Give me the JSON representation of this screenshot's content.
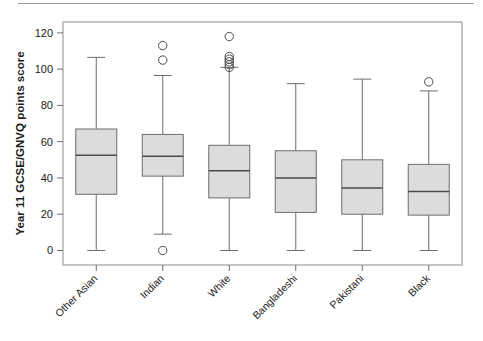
{
  "figure": {
    "top_rule_visible": true,
    "frame_color": "#8c8c8c",
    "background": "#ffffff"
  },
  "chart_data": {
    "type": "box",
    "title": "",
    "subtitle": "",
    "xlabel": "",
    "ylabel": "Year 11 GCSE/GNVQ points score",
    "ylim": [
      -8,
      126
    ],
    "yticks": [
      0,
      20,
      40,
      60,
      80,
      100,
      120
    ],
    "ytick_labels": [
      "0",
      "20",
      "40",
      "60",
      "80",
      "100",
      "120"
    ],
    "grid": false,
    "legend": null,
    "categories": [
      "Other Asian",
      "Indian",
      "White",
      "Bangladeshi",
      "Pakistani",
      "Black"
    ],
    "box_fill": "#dcdcdc",
    "box_edge": "#6e6e6e",
    "median_color": "#4a4a4a",
    "whisker_color": "#6e6e6e",
    "outlier_edge": "#4a4a4a",
    "boxes": [
      {
        "category": "Other Asian",
        "whisker_low": 0,
        "q1": 31,
        "median": 52.5,
        "q3": 67,
        "whisker_high": 106.5,
        "outliers": []
      },
      {
        "category": "Indian",
        "whisker_low": 9,
        "q1": 41,
        "median": 52,
        "q3": 64,
        "whisker_high": 96.5,
        "outliers": [
          113,
          105,
          0
        ]
      },
      {
        "category": "White",
        "whisker_low": 0,
        "q1": 29,
        "median": 44,
        "q3": 58,
        "whisker_high": 101,
        "outliers": [
          118,
          107,
          105.5,
          104,
          102.5,
          101
        ]
      },
      {
        "category": "Bangladeshi",
        "whisker_low": 0,
        "q1": 21,
        "median": 40,
        "q3": 55,
        "whisker_high": 92,
        "outliers": []
      },
      {
        "category": "Pakistani",
        "whisker_low": 0,
        "q1": 20,
        "median": 34.5,
        "q3": 50,
        "whisker_high": 94.5,
        "outliers": []
      },
      {
        "category": "Black",
        "whisker_low": 0,
        "q1": 19.5,
        "median": 32.5,
        "q3": 47.5,
        "whisker_high": 88,
        "outliers": [
          93
        ]
      }
    ]
  }
}
